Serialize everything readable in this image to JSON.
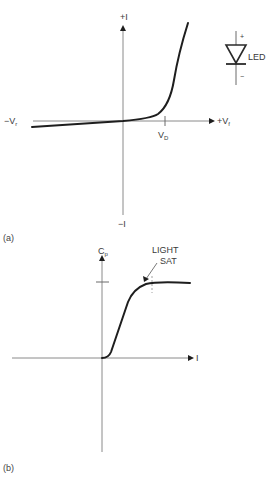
{
  "panels": {
    "a": {
      "label": "(a)",
      "y_axis": {
        "positive_label": "+I",
        "negative_label": "−I"
      },
      "x_axis": {
        "negative_label_main": "−V",
        "negative_label_sub": "r",
        "positive_label_main": "+V",
        "positive_label_sub": "f"
      },
      "threshold": {
        "label_main": "V",
        "label_sub": "D"
      },
      "symbol": {
        "name": "LED",
        "plus": "+",
        "minus": "−"
      }
    },
    "b": {
      "label": "(b)",
      "y_axis": {
        "label_main": "C",
        "label_sub": "p"
      },
      "x_axis": {
        "label": "I"
      },
      "annotation": {
        "line1": "LIGHT",
        "line2": "SAT"
      }
    }
  },
  "colors": {
    "curve": "#1e1e1e",
    "axis": "#8a8a8a",
    "text": "#3a3a3a",
    "background": "#ffffff"
  }
}
